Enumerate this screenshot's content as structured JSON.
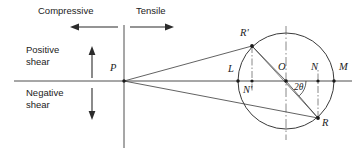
{
  "figure": {
    "type": "mohrs-circle-diagram",
    "axes": {
      "horizontal_axis_label": "normal stress axis",
      "vertical_axis_label": "shear stress axis",
      "quadrant_labels": {
        "left_top": "Compressive",
        "right_top": "Tensile",
        "left_upper": "Positive shear",
        "left_lower": "Negative shear"
      }
    },
    "region_labels": [
      {
        "id": "compressive",
        "text": "Compressive",
        "x": 38,
        "y": 12
      },
      {
        "id": "tensile",
        "text": "Tensile",
        "x": 136,
        "y": 12
      },
      {
        "id": "positive-shear",
        "text": "Positive",
        "x": 26,
        "y": 51
      },
      {
        "id": "positive-shear-2",
        "text": "shear",
        "x": 26,
        "y": 63
      },
      {
        "id": "negative-shear",
        "text": "Negative",
        "x": 26,
        "y": 92
      },
      {
        "id": "negative-shear-2",
        "text": "shear",
        "x": 26,
        "y": 104
      }
    ],
    "points": [
      {
        "id": "P",
        "label": "P",
        "x": 124,
        "y": 81,
        "lx": 110,
        "ly": 66
      },
      {
        "id": "R1",
        "label": "R'",
        "x": 252,
        "y": 46,
        "lx": 240,
        "ly": 31
      },
      {
        "id": "L",
        "label": "L",
        "x": 238,
        "y": 81,
        "lx": 228,
        "ly": 66
      },
      {
        "id": "N1",
        "label": "N'",
        "x": 252,
        "y": 81,
        "lx": 243,
        "ly": 85
      },
      {
        "id": "O",
        "label": "O",
        "x": 286,
        "y": 81,
        "lx": 278,
        "ly": 64
      },
      {
        "id": "N",
        "label": "N",
        "x": 318,
        "y": 81,
        "lx": 311,
        "ly": 64
      },
      {
        "id": "M",
        "label": "M",
        "x": 334,
        "y": 81,
        "lx": 340,
        "ly": 64
      },
      {
        "id": "R",
        "label": "R",
        "x": 318,
        "y": 118,
        "lx": 323,
        "ly": 120
      }
    ],
    "angle": {
      "id": "two-theta",
      "label": "2θ",
      "x": 292,
      "y": 86
    },
    "circle": {
      "cx": 286,
      "cy": 81,
      "r": 48
    },
    "colors": {
      "line": "#3a3a3a",
      "text": "#222222",
      "background": "#ffffff"
    }
  }
}
